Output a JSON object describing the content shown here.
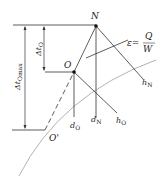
{
  "diagram": {
    "points": {
      "N": "N",
      "O": "O",
      "O_prime": "O'"
    },
    "dimensions": {
      "delta_t_O": {
        "main": "Δt",
        "sub": "O"
      },
      "delta_t_Omax": {
        "main": "Δt",
        "sub": "Omax"
      }
    },
    "line_labels": {
      "h_N": {
        "main": "h",
        "sub": "N"
      },
      "h_O": {
        "main": "h",
        "sub": "O"
      },
      "d_N": {
        "main": "d",
        "sub": "N"
      },
      "d_O": {
        "main": "d",
        "sub": "O"
      }
    },
    "equation": {
      "lhs": "ε=",
      "numerator": "Q",
      "denominator": "W"
    },
    "colors": {
      "line": "#333333",
      "curve": "#999999"
    }
  }
}
